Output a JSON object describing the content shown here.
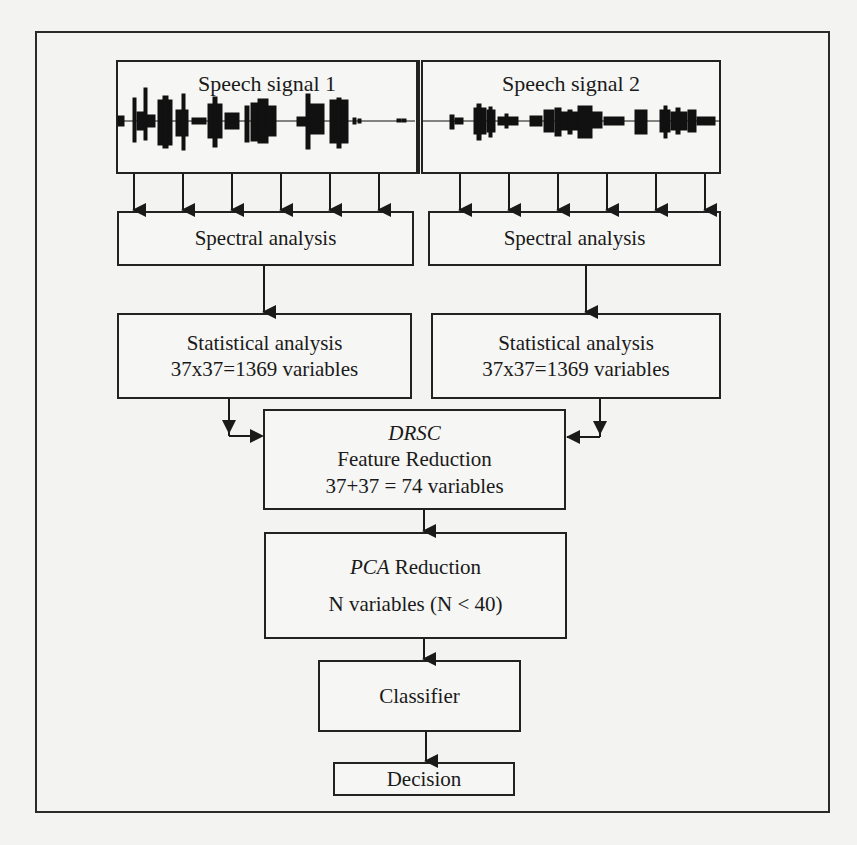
{
  "diagram": {
    "type": "flowchart",
    "nodes": {
      "speech_signal_1": {
        "label": "Speech signal 1"
      },
      "speech_signal_2": {
        "label": "Speech signal 2"
      },
      "spectral_1": {
        "label": "Spectral analysis"
      },
      "spectral_2": {
        "label": "Spectral analysis"
      },
      "statistical_1": {
        "label": "Statistical analysis",
        "sublabel": "37x37=1369 variables"
      },
      "statistical_2": {
        "label": "Statistical analysis",
        "sublabel": "37x37=1369 variables"
      },
      "drsc": {
        "label_italic": "DRSC",
        "label": "Feature Reduction",
        "sublabel": "37+37 = 74 variables"
      },
      "pca": {
        "label_italic": "PCA",
        "label_suffix": " Reduction",
        "sublabel": "N variables (N < 40)"
      },
      "classifier": {
        "label": "Classifier"
      },
      "decision": {
        "label": "Decision"
      }
    },
    "edges": [
      {
        "from": "speech_signal_1",
        "to": "spectral_1",
        "count": 6
      },
      {
        "from": "speech_signal_2",
        "to": "spectral_2",
        "count": 6
      },
      {
        "from": "spectral_1",
        "to": "statistical_1"
      },
      {
        "from": "spectral_2",
        "to": "statistical_2"
      },
      {
        "from": "statistical_1",
        "to": "drsc"
      },
      {
        "from": "statistical_2",
        "to": "drsc"
      },
      {
        "from": "drsc",
        "to": "pca"
      },
      {
        "from": "pca",
        "to": "classifier"
      },
      {
        "from": "classifier",
        "to": "decision"
      }
    ]
  },
  "colors": {
    "background": "#f3f3f1",
    "stroke": "#222222",
    "waveform": "#111111"
  }
}
